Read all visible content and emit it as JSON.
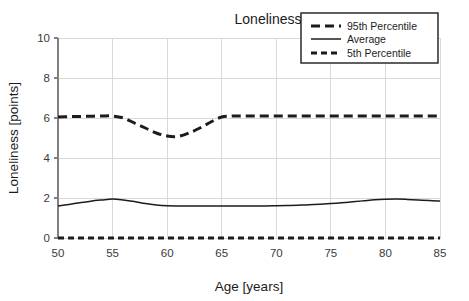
{
  "chart_data": {
    "type": "line",
    "title": "Loneliness",
    "xlabel": "Age [years]",
    "ylabel": "Loneliness [points]",
    "xlim": [
      50,
      85
    ],
    "ylim": [
      0,
      10
    ],
    "xticks": [
      "50",
      "55",
      "60",
      "65",
      "70",
      "75",
      "80",
      "85"
    ],
    "yticks": [
      "0",
      "2",
      "4",
      "6",
      "8",
      "10"
    ],
    "grid": true,
    "legend_position": "top-right",
    "x": [
      50,
      51,
      52,
      53,
      54,
      55,
      56,
      57,
      58,
      59,
      60,
      61,
      62,
      63,
      64,
      65,
      66,
      67,
      68,
      69,
      70,
      71,
      72,
      73,
      74,
      75,
      76,
      77,
      78,
      79,
      80,
      81,
      82,
      83,
      84,
      85
    ],
    "series": [
      {
        "name": "95th Percentile",
        "style": "dashed-long",
        "color": "#1c1c1c",
        "values": [
          6.05,
          6.07,
          6.08,
          6.09,
          6.1,
          6.1,
          6.0,
          5.75,
          5.5,
          5.25,
          5.1,
          5.08,
          5.25,
          5.5,
          5.8,
          6.05,
          6.1,
          6.1,
          6.1,
          6.1,
          6.1,
          6.1,
          6.1,
          6.1,
          6.1,
          6.1,
          6.1,
          6.1,
          6.1,
          6.1,
          6.1,
          6.1,
          6.1,
          6.1,
          6.1,
          6.1
        ]
      },
      {
        "name": "Average",
        "style": "solid",
        "color": "#1c1c1c",
        "values": [
          1.6,
          1.68,
          1.76,
          1.84,
          1.9,
          1.95,
          1.9,
          1.82,
          1.72,
          1.65,
          1.61,
          1.6,
          1.6,
          1.6,
          1.6,
          1.6,
          1.6,
          1.6,
          1.6,
          1.6,
          1.61,
          1.62,
          1.64,
          1.66,
          1.69,
          1.72,
          1.76,
          1.81,
          1.86,
          1.91,
          1.94,
          1.95,
          1.93,
          1.9,
          1.87,
          1.85
        ]
      },
      {
        "name": "5th Percentile",
        "style": "dashed-short",
        "color": "#1c1c1c",
        "values": [
          0,
          0,
          0,
          0,
          0,
          0,
          0,
          0,
          0,
          0,
          0,
          0,
          0,
          0,
          0,
          0,
          0,
          0,
          0,
          0,
          0,
          0,
          0,
          0,
          0,
          0,
          0,
          0,
          0,
          0,
          0,
          0,
          0,
          0,
          0,
          0
        ]
      }
    ]
  },
  "legend": {
    "items": [
      {
        "label": "95th Percentile",
        "style": "dashed-long"
      },
      {
        "label": "Average",
        "style": "solid"
      },
      {
        "label": "5th Percentile",
        "style": "dashed-short"
      }
    ]
  },
  "colors": {
    "line": "#1c1c1c",
    "grid": "#d9d9d9",
    "axis": "#808080",
    "background": "#ffffff",
    "text": "#1c1c1c"
  }
}
